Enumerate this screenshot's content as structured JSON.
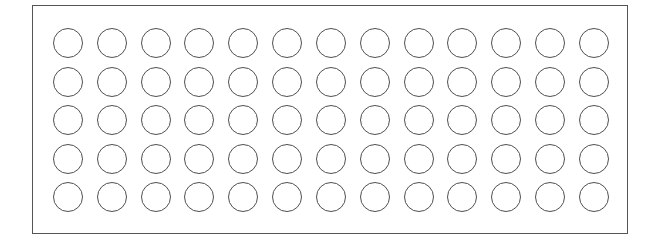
{
  "figure": {
    "rows": 5,
    "columns": 13,
    "total_circles": 65,
    "circle_style": "outline",
    "colors": {
      "background": "#ffffff",
      "stroke": "#505050",
      "frame": "#555555"
    }
  }
}
